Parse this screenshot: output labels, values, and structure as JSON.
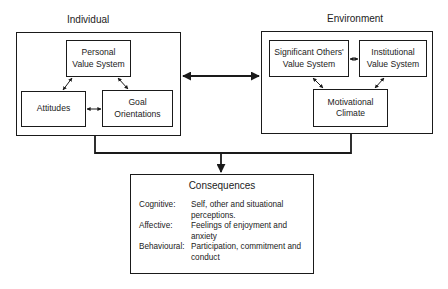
{
  "diagram": {
    "individual": {
      "label": "Individual",
      "boxes": {
        "personal_value_system": [
          "Personal",
          "Value System"
        ],
        "attitudes": [
          "Attitudes"
        ],
        "goal_orientations": [
          "Goal",
          "Orientations"
        ]
      }
    },
    "environment": {
      "label": "Environment",
      "boxes": {
        "significant_others": [
          "Significant Others'",
          "Value System"
        ],
        "institutional": [
          "Institutional",
          "Value System"
        ],
        "motivational_climate": [
          "Motivational",
          "Climate"
        ]
      }
    },
    "consequences": {
      "title": "Consequences",
      "rows": [
        {
          "key": "Cognitive:",
          "value": "Self, other and situational perceptions."
        },
        {
          "key": "Affective:",
          "value": "Feelings of enjoyment and anxiety"
        },
        {
          "key": "Behavioural:",
          "value": "Participation, commitment and conduct"
        }
      ]
    },
    "colors": {
      "line": "#1a1a1a",
      "background": "#ffffff"
    }
  }
}
